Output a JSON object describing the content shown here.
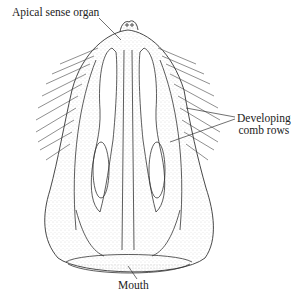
{
  "figure": {
    "labels": {
      "apical_sense_organ": "Apical sense organ",
      "developing_comb_rows_line1": "Developing",
      "developing_comb_rows_line2": "comb rows",
      "mouth": "Mouth"
    },
    "colors": {
      "ink": "#333333",
      "stipple": "#bdbdbd",
      "background": "#ffffff"
    }
  }
}
